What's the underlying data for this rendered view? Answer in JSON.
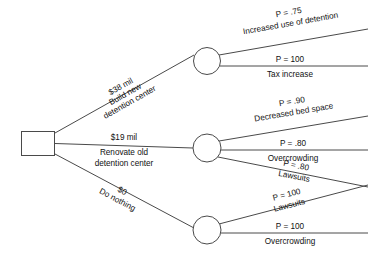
{
  "diagram": {
    "type": "decision-tree",
    "title": "",
    "root": {
      "shape": "square",
      "label": ""
    },
    "decisions": [
      {
        "id": "build-new",
        "cost": "$38 mil",
        "label_line1": "Build new",
        "label_line2": "detention center",
        "outcomes": [
          {
            "probability": "P = .75",
            "label": "Increased use of detention"
          },
          {
            "probability": "P = 100",
            "label": "Tax increase"
          }
        ]
      },
      {
        "id": "renovate-old",
        "cost": "$19 mil",
        "label_line1": "Renovate old",
        "label_line2": "detention center",
        "outcomes": [
          {
            "probability": "P = .90",
            "label": "Decreased bed space"
          },
          {
            "probability": "P = .80",
            "label": "Overcrowding"
          },
          {
            "probability": "P = .80",
            "label": "Lawsuits"
          }
        ]
      },
      {
        "id": "do-nothing",
        "cost": "$0",
        "label_line1": "Do nothing",
        "label_line2": "",
        "outcomes": [
          {
            "probability": "P = 100",
            "label": "Lawsuits"
          },
          {
            "probability": "P = 100",
            "label": "Overcrowding"
          }
        ]
      }
    ],
    "colors": {
      "line": "#4a4a4a",
      "text": "#111111",
      "background": "#ffffff"
    }
  }
}
